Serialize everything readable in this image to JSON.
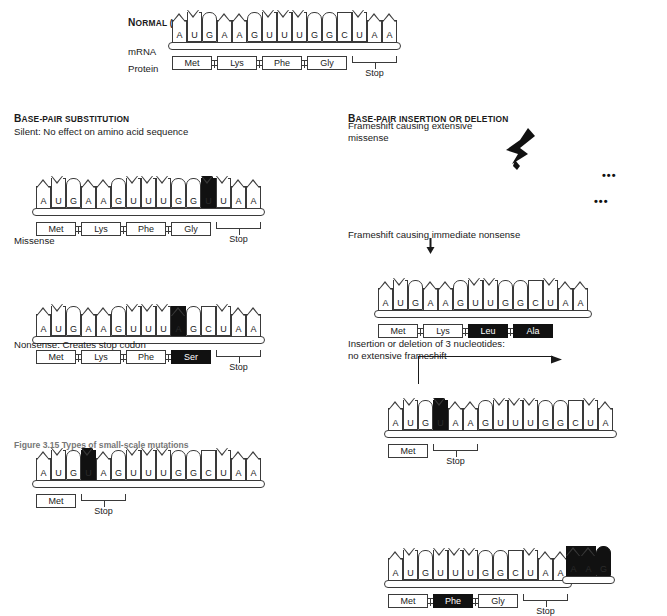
{
  "figure": {
    "caption": "Figure 3.15 Types of small-scale mutations"
  },
  "normal": {
    "title_small_caps_lead": "N",
    "title": "ORMAL (WILD TYPE) GENE",
    "mrna_label": "mRNA",
    "protein_label": "Protein",
    "bases": [
      "A",
      "U",
      "G",
      "A",
      "A",
      "G",
      "U",
      "U",
      "U",
      "G",
      "G",
      "C",
      "U",
      "A",
      "A"
    ],
    "proteins": [
      "Met",
      "Lys",
      "Phe",
      "Gly"
    ],
    "stop_label": "Stop"
  },
  "substitution": {
    "section_lead": "B",
    "section_title": "ASE-PAIR SUBSTITUTION",
    "silent": {
      "heading": "Silent: No effect on amino acid sequence",
      "bases": [
        "A",
        "U",
        "G",
        "A",
        "A",
        "G",
        "U",
        "U",
        "U",
        "G",
        "G",
        "U",
        "U",
        "A",
        "A"
      ],
      "mutated_index": 11,
      "proteins": [
        "Met",
        "Lys",
        "Phe",
        "Gly"
      ],
      "stop_label": "Stop"
    },
    "missense": {
      "heading": "Missense",
      "bases": [
        "A",
        "U",
        "G",
        "A",
        "A",
        "G",
        "U",
        "U",
        "U",
        "A",
        "G",
        "C",
        "U",
        "A",
        "A"
      ],
      "mutated_index": 9,
      "proteins": [
        "Met",
        "Lys",
        "Phe",
        "Ser"
      ],
      "black_protein_index": 3,
      "stop_label": "Stop"
    },
    "nonsense": {
      "heading": "Nonsense: Creates stop codon",
      "bases": [
        "A",
        "U",
        "G",
        "U",
        "A",
        "G",
        "U",
        "U",
        "U",
        "G",
        "G",
        "C",
        "U",
        "A",
        "A"
      ],
      "mutated_index": 3,
      "proteins": [
        "Met"
      ],
      "stop_label": "Stop"
    }
  },
  "indel": {
    "section_lead": "B",
    "section_title": "ASE-PAIR INSERTION OR DELETION",
    "frameshift_missense": {
      "heading_line1": "Frameshift causing extensive",
      "heading_line2": "missense",
      "bases": [
        "A",
        "U",
        "G",
        "A",
        "A",
        "G",
        "U",
        "U",
        "G",
        "G",
        "C",
        "U",
        "A",
        "A"
      ],
      "trailing_dots": "•••",
      "proteins": [
        "Met",
        "Lys",
        "Leu",
        "Ala"
      ],
      "black_protein_indices": [
        2,
        3
      ],
      "protein_trailing_dots": "•••"
    },
    "frameshift_nonsense": {
      "heading": "Frameshift causing immediate nonsense",
      "bases": [
        "A",
        "U",
        "G",
        "U",
        "A",
        "A",
        "G",
        "U",
        "U",
        "U",
        "G",
        "G",
        "C",
        "U",
        "A"
      ],
      "mutated_index": 3,
      "proteins": [
        "Met"
      ],
      "stop_label": "Stop"
    },
    "three_nucleotide": {
      "heading_line1": "Insertion or deletion of 3 nucleotides:",
      "heading_line2": "no extensive frameshift",
      "removed_bases": [
        "A",
        "A",
        "G"
      ],
      "bases": [
        "A",
        "U",
        "G",
        "U",
        "U",
        "U",
        "G",
        "G",
        "C",
        "U",
        "A",
        "A"
      ],
      "proteins": [
        "Met",
        "Phe",
        "Gly"
      ],
      "black_protein_index": 1,
      "stop_label": "Stop"
    }
  },
  "colors": {
    "ink": "#1a1a1a",
    "stroke": "#3a3a3a",
    "highlight": "#111111",
    "paper": "#ffffff"
  }
}
